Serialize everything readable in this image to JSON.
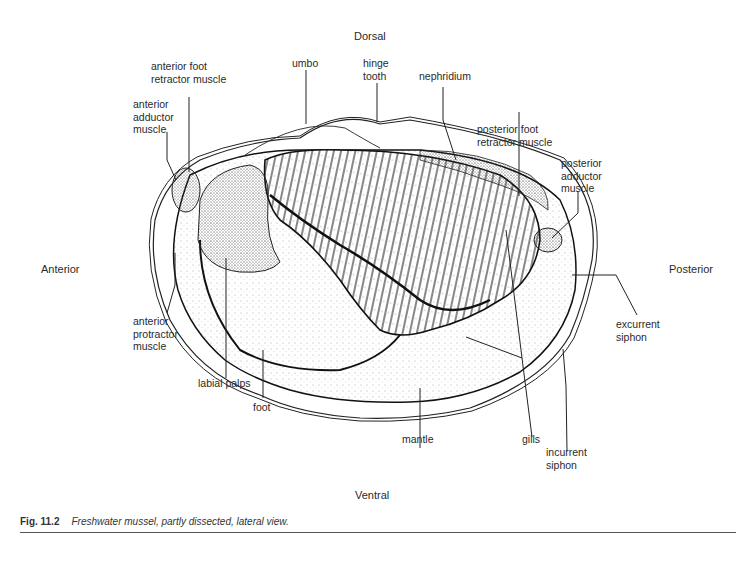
{
  "figure": {
    "number": "Fig. 11.2",
    "caption": "Freshwater mussel, partly dissected, lateral view."
  },
  "orientation": {
    "dorsal": "Dorsal",
    "ventral": "Ventral",
    "anterior": "Anterior",
    "posterior": "Posterior"
  },
  "labels": {
    "anterior_foot_retractor": "anterior foot\nretractor muscle",
    "anterior_adductor": "anterior\nadductor\nmuscle",
    "umbo": "umbo",
    "hinge_tooth": "hinge\ntooth",
    "nephridium": "nephridium",
    "posterior_foot_retractor": "posterior foot\nretractor muscle",
    "posterior_adductor": "posterior\nadductor\nmuscle",
    "excurrent_siphon": "excurrent\nsiphon",
    "anterior_protractor": "anterior\nprotractor\nmuscle",
    "labial_palps": "labial palps",
    "foot": "foot",
    "mantle": "mantle",
    "gills": "gills",
    "incurrent_siphon": "incurrent\nsiphon"
  }
}
